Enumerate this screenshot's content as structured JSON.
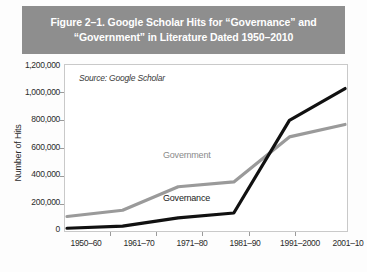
{
  "figure": {
    "title_line1": "Figure 2–1. Google Scholar Hits for “Governance” and",
    "title_line2": "“Government” in Literature Dated 1950–2010",
    "title_bar_color": "#8e8e8e"
  },
  "chart_data": {
    "type": "line",
    "title": "Figure 2–1. Google Scholar Hits for “Governance” and “Government” in Literature Dated 1950–2010",
    "source_note": "Source: Google Scholar",
    "xlabel": "",
    "ylabel": "Number of Hits",
    "categories": [
      "1950–60",
      "1961–70",
      "1971–80",
      "1981–90",
      "1991–2000",
      "2001–10"
    ],
    "ylim": [
      0,
      1200000
    ],
    "ytick_labels": [
      "1,200,000",
      "1,000,000",
      "800,000",
      "600,000",
      "400,000",
      "200,000",
      "0"
    ],
    "ytick_values": [
      1200000,
      1000000,
      800000,
      600000,
      400000,
      200000,
      0
    ],
    "grid": false,
    "legend": "inline-labels",
    "series": [
      {
        "name": "Government",
        "color": "#9a9a9a",
        "values": [
          105000,
          150000,
          320000,
          355000,
          680000,
          770000
        ]
      },
      {
        "name": "Governance",
        "color": "#111111",
        "values": [
          20000,
          35000,
          95000,
          130000,
          800000,
          1030000
        ]
      }
    ]
  }
}
